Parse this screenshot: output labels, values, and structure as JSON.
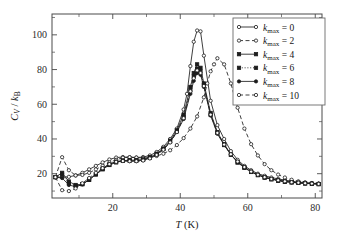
{
  "figure": {
    "background": "#ffffff",
    "frame_color": "#4a4a4a",
    "line_color": "#1c1c1c"
  },
  "axes": {
    "x_title_symbol": "T",
    "x_title_unit": " (K)",
    "y_title": "CV / kB",
    "x_ticklabels": [
      "20",
      "40",
      "60",
      "80"
    ],
    "y_ticklabels": [
      "20",
      "40",
      "60",
      "80",
      "100"
    ]
  },
  "legend": {
    "position": "top-right",
    "entries": [
      {
        "label": "kmax = 0",
        "sym": "k",
        "sub": "max",
        "rhs": "= 0",
        "style": "solid",
        "marker": "circle-open"
      },
      {
        "label": "kmax = 2",
        "sym": "k",
        "sub": "max",
        "rhs": "= 2",
        "style": "dashed",
        "marker": "circle-open"
      },
      {
        "label": "kmax = 4",
        "sym": "k",
        "sub": "max",
        "rhs": "= 4",
        "style": "solid",
        "marker": "square-filled"
      },
      {
        "label": "kmax = 6",
        "sym": "k",
        "sub": "max",
        "rhs": "= 6",
        "style": "dotted",
        "marker": "square-filled"
      },
      {
        "label": "kmax = 8",
        "sym": "k",
        "sub": "max",
        "rhs": "= 8",
        "style": "solid",
        "marker": "circle-filled"
      },
      {
        "label": "kmax = 10",
        "sym": "k",
        "sub": "max",
        "rhs": "= 10",
        "style": "dashed",
        "marker": "circle-open"
      }
    ]
  },
  "chart_data": {
    "type": "line",
    "title": "",
    "xlabel": "T (K)",
    "ylabel": "CV / kB",
    "xlim": [
      2,
      82
    ],
    "ylim": [
      6,
      112
    ],
    "xticks": [
      20,
      40,
      60,
      80
    ],
    "yticks": [
      20,
      40,
      60,
      80,
      100
    ],
    "xminor": [
      10,
      30,
      50,
      70
    ],
    "yminor": [
      10,
      30,
      50,
      70,
      90,
      110
    ],
    "grid": false,
    "legend_position": "upper right",
    "series": [
      {
        "name": "kmax = 0",
        "style": "solid",
        "marker": "circle-open",
        "x": [
          3,
          5,
          7,
          9,
          11,
          13,
          15,
          17,
          19,
          21,
          23,
          25,
          27,
          29,
          31,
          33,
          35,
          37,
          39,
          41,
          42,
          43,
          44,
          45,
          46,
          47,
          49,
          51,
          53,
          55,
          57,
          59,
          61,
          63,
          65,
          67,
          69,
          71,
          73,
          75,
          77,
          79,
          81
        ],
        "y": [
          18.0,
          18.0,
          18.2,
          19.0,
          20.5,
          22.5,
          24.5,
          26.5,
          28.2,
          29.3,
          29.6,
          29.5,
          29.3,
          29.6,
          30.5,
          32.5,
          35.5,
          40.0,
          46.0,
          57.0,
          66.0,
          82.0,
          96.0,
          102.5,
          102.0,
          88.0,
          62.0,
          48.0,
          40.0,
          33.0,
          28.0,
          24.5,
          22.0,
          20.0,
          18.8,
          17.8,
          17.0,
          16.3,
          15.7,
          15.2,
          14.8,
          14.5,
          14.3
        ]
      },
      {
        "name": "kmax = 2",
        "style": "dashed",
        "marker": "circle-open",
        "x": [
          3,
          5,
          7,
          9,
          11,
          13,
          15,
          17,
          19,
          21,
          23,
          25,
          27,
          29,
          31,
          33,
          35,
          37,
          39,
          41,
          43,
          45,
          47,
          48,
          49,
          50,
          51,
          53,
          55,
          57,
          59,
          61,
          63,
          65,
          67,
          69,
          71,
          73,
          75,
          77,
          79,
          81
        ],
        "y": [
          18.0,
          29.5,
          22.0,
          19.0,
          19.3,
          20.5,
          22.5,
          24.5,
          26.5,
          28.0,
          29.2,
          29.5,
          29.3,
          29.0,
          29.3,
          30.2,
          31.5,
          33.5,
          36.5,
          40.5,
          46.0,
          53.0,
          64.0,
          72.0,
          79.0,
          83.0,
          86.5,
          83.0,
          72.0,
          58.0,
          46.0,
          37.0,
          30.5,
          25.5,
          22.0,
          19.5,
          17.8,
          16.5,
          15.6,
          15.0,
          14.6,
          14.3
        ]
      },
      {
        "name": "kmax = 4",
        "style": "solid",
        "marker": "square-filled",
        "x": [
          3,
          5,
          7,
          9,
          11,
          13,
          15,
          17,
          19,
          21,
          23,
          25,
          27,
          29,
          31,
          33,
          35,
          37,
          39,
          41,
          43,
          44,
          45,
          46,
          47,
          49,
          51,
          53,
          55,
          57,
          59,
          61,
          63,
          65,
          67,
          69,
          71,
          73,
          75,
          77,
          79,
          81
        ],
        "y": [
          18.0,
          20.5,
          15.5,
          13.5,
          14.0,
          16.5,
          19.5,
          22.5,
          25.0,
          26.5,
          27.5,
          27.8,
          27.8,
          28.2,
          29.5,
          31.5,
          34.5,
          39.0,
          45.0,
          54.0,
          70.0,
          78.0,
          83.0,
          81.0,
          72.0,
          55.0,
          44.0,
          37.0,
          31.0,
          26.5,
          23.5,
          21.0,
          19.2,
          17.8,
          16.8,
          16.0,
          15.4,
          15.0,
          14.7,
          14.4,
          14.2,
          14.0
        ]
      },
      {
        "name": "kmax = 6",
        "style": "dotted",
        "marker": "square-filled",
        "x": [
          3,
          5,
          7,
          9,
          11,
          13,
          15,
          17,
          19,
          21,
          23,
          25,
          27,
          29,
          31,
          33,
          35,
          37,
          39,
          41,
          43,
          44,
          45,
          46,
          47,
          49,
          51,
          53,
          55,
          57,
          59,
          61,
          63,
          65,
          67,
          69,
          71,
          73,
          75,
          77,
          79,
          81
        ],
        "y": [
          18.0,
          19.5,
          14.5,
          13.0,
          14.0,
          16.5,
          19.8,
          22.8,
          25.2,
          26.8,
          27.5,
          27.5,
          27.5,
          28.0,
          29.2,
          31.2,
          34.2,
          38.5,
          44.5,
          52.5,
          68.0,
          76.0,
          80.5,
          79.0,
          71.0,
          54.0,
          43.5,
          36.5,
          31.0,
          26.5,
          23.5,
          21.0,
          19.2,
          17.8,
          16.8,
          16.0,
          15.4,
          15.0,
          14.7,
          14.4,
          14.2,
          14.0
        ]
      },
      {
        "name": "kmax = 8",
        "style": "solid",
        "marker": "circle-filled",
        "x": [
          3,
          5,
          7,
          9,
          11,
          13,
          15,
          17,
          19,
          21,
          23,
          25,
          27,
          29,
          31,
          33,
          35,
          37,
          39,
          41,
          43,
          44,
          45,
          46,
          47,
          49,
          51,
          53,
          55,
          57,
          59,
          61,
          63,
          65,
          67,
          69,
          71,
          73,
          75,
          77,
          79,
          81
        ],
        "y": [
          18.0,
          17.5,
          13.5,
          12.5,
          13.8,
          16.5,
          19.8,
          23.0,
          25.5,
          27.0,
          27.5,
          27.3,
          27.3,
          27.8,
          29.0,
          31.0,
          34.0,
          38.2,
          44.0,
          51.5,
          66.0,
          73.5,
          78.0,
          77.0,
          70.0,
          53.5,
          43.0,
          36.5,
          31.0,
          26.8,
          23.8,
          21.2,
          19.4,
          18.0,
          17.0,
          16.2,
          15.6,
          15.1,
          14.8,
          14.5,
          14.3,
          14.1
        ]
      },
      {
        "name": "kmax = 10",
        "style": "dashed",
        "marker": "circle-open",
        "x": [
          3,
          5,
          7,
          9,
          11,
          13,
          15,
          17,
          19,
          21,
          23,
          25,
          27,
          29,
          31,
          33,
          35,
          37,
          39,
          41,
          43,
          44,
          45,
          46,
          47,
          49,
          51,
          53,
          55,
          57,
          59,
          61,
          63,
          65,
          67,
          69,
          71,
          73,
          75,
          77,
          79,
          81
        ],
        "y": [
          18.0,
          10.5,
          10.0,
          11.5,
          14.5,
          17.5,
          20.5,
          23.2,
          25.5,
          26.8,
          27.3,
          27.2,
          27.2,
          27.6,
          28.8,
          30.8,
          33.8,
          38.0,
          44.0,
          52.0,
          67.5,
          75.0,
          79.5,
          78.0,
          70.5,
          54.0,
          43.5,
          36.8,
          31.2,
          27.0,
          23.8,
          21.2,
          19.4,
          18.0,
          17.0,
          16.2,
          15.6,
          15.1,
          14.8,
          14.5,
          14.3,
          14.1
        ]
      }
    ]
  }
}
